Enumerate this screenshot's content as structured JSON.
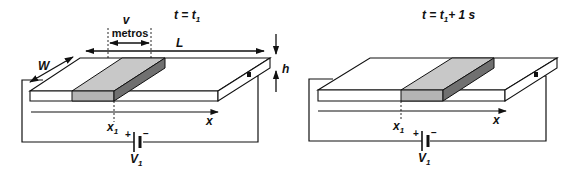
{
  "left_panel": {
    "title": "t = t",
    "title_sub": "1",
    "velocity_label": "v",
    "velocity_unit": "metros",
    "length_label": "L",
    "width_label": "W",
    "height_label": "h",
    "position_label": "x",
    "position_sub": "1",
    "axis_label": "x",
    "battery_plus": "+",
    "battery_minus": "−",
    "voltage_label": "V",
    "voltage_sub": "1"
  },
  "right_panel": {
    "title_prefix": "t = t",
    "title_sub": "1",
    "title_suffix": "+ 1 s",
    "position_label": "x",
    "position_sub": "1",
    "axis_label": "x",
    "battery_plus": "+",
    "battery_minus": "−",
    "voltage_label": "V",
    "voltage_sub": "1"
  },
  "colors": {
    "slab_fill": "#ffffff",
    "charge_top": "#c8c8c8",
    "charge_front": "#b4b4b4",
    "charge_side": "#707070",
    "stroke": "#111111"
  }
}
